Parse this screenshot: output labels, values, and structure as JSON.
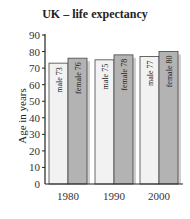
{
  "chart_data": {
    "type": "bar",
    "title": "UK – life expectancy",
    "xlabel": "",
    "ylabel": "Age in years",
    "ylim": [
      0,
      90
    ],
    "yticks": [
      0,
      10,
      20,
      30,
      40,
      50,
      60,
      70,
      80,
      90
    ],
    "categories": [
      "1980",
      "1990",
      "2000"
    ],
    "series": [
      {
        "name": "male",
        "values": [
          73,
          75,
          77
        ],
        "color": "#f2f2f2"
      },
      {
        "name": "female",
        "values": [
          76,
          78,
          80
        ],
        "color": "#b3b3b3"
      }
    ],
    "bar_labels": [
      [
        "male 73",
        "female 76"
      ],
      [
        "male 75",
        "female 78"
      ],
      [
        "male 77",
        "female 80"
      ]
    ],
    "grid": false,
    "legend": "none"
  }
}
